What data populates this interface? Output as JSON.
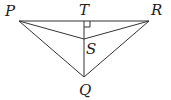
{
  "diagram": {
    "type": "geometry-figure",
    "points": {
      "P": {
        "label": "P",
        "x": 19,
        "y": 21
      },
      "T": {
        "label": "T",
        "x": 84,
        "y": 21
      },
      "R": {
        "label": "R",
        "x": 149,
        "y": 21
      },
      "S": {
        "label": "S",
        "x": 84,
        "y": 39
      },
      "Q": {
        "label": "Q",
        "x": 84,
        "y": 77
      }
    },
    "segments": [
      "PR",
      "PQ",
      "QR",
      "PS",
      "SR",
      "TQ"
    ],
    "right_angle_marker": {
      "at": "T",
      "size": 6
    },
    "colors": {
      "line": "#333333",
      "label": "#222222",
      "background": "#ffffff"
    }
  }
}
